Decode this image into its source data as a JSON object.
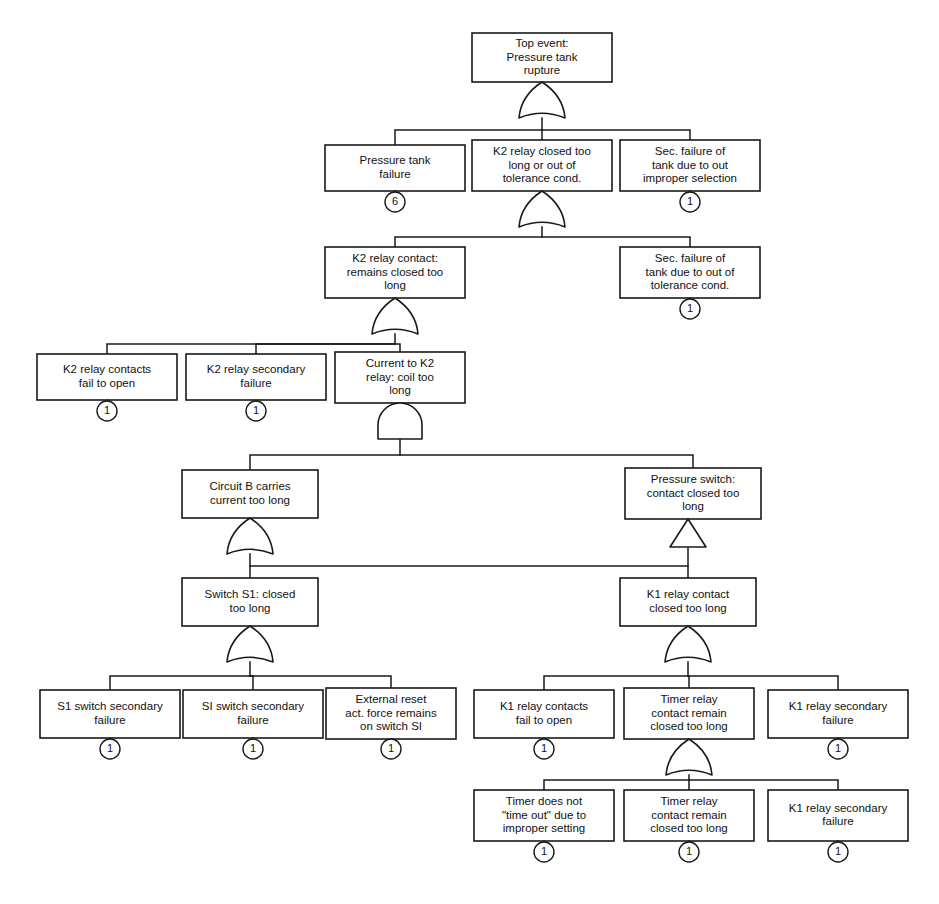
{
  "diagram": {
    "kind": "fault-tree",
    "width": 939,
    "height": 904,
    "colors": {
      "background": "#ffffff",
      "stroke": "#1a1a1a",
      "text": "#111111",
      "box_fill": "#ffffff"
    }
  },
  "nodes": [
    {
      "id": "top-event",
      "label": "Top event:\nPressure tank\nrupture",
      "x": 472,
      "y": 33,
      "w": 140,
      "h": 49,
      "gate": {
        "type": "or",
        "cx": 542,
        "cy": 82,
        "w": 46,
        "h": 36
      },
      "marker": null
    },
    {
      "id": "pressure-tank-failure",
      "label": "Pressure tank\nfailure",
      "x": 325,
      "y": 145,
      "w": 140,
      "h": 46,
      "gate": null,
      "marker": {
        "type": "circle",
        "value": "6",
        "cx": 395,
        "cy": 202,
        "r": 10
      }
    },
    {
      "id": "k2-relay-closed-too-long",
      "label": "K2 relay closed too\nlong or out of\ntolerance cond.",
      "x": 472,
      "y": 140,
      "w": 140,
      "h": 51,
      "gate": {
        "type": "or",
        "cx": 542,
        "cy": 191,
        "w": 46,
        "h": 36
      },
      "marker": null
    },
    {
      "id": "sec-failure-tank-improper-selection",
      "label": "Sec. failure of\ntank due to out\nimproper selection",
      "x": 620,
      "y": 140,
      "w": 140,
      "h": 51,
      "gate": null,
      "marker": {
        "type": "circle",
        "value": "1",
        "cx": 690,
        "cy": 202,
        "r": 10
      }
    },
    {
      "id": "k2-relay-contact-remains-closed",
      "label": "K2 relay contact:\nremains closed too\nlong",
      "x": 325,
      "y": 247,
      "w": 140,
      "h": 51,
      "gate": {
        "type": "or",
        "cx": 395,
        "cy": 298,
        "w": 46,
        "h": 36
      },
      "marker": null
    },
    {
      "id": "sec-failure-tank-tolerance",
      "label": "Sec. failure of\ntank due to out of\ntolerance cond.",
      "x": 620,
      "y": 247,
      "w": 140,
      "h": 51,
      "gate": null,
      "marker": {
        "type": "circle",
        "value": "1",
        "cx": 690,
        "cy": 309,
        "r": 10
      }
    },
    {
      "id": "k2-relay-contacts-fail-to-open",
      "label": "K2 relay contacts\nfail to open",
      "x": 37,
      "y": 354,
      "w": 140,
      "h": 46,
      "gate": null,
      "marker": {
        "type": "circle",
        "value": "1",
        "cx": 107,
        "cy": 411,
        "r": 10
      }
    },
    {
      "id": "k2-relay-secondary-failure",
      "label": "K2 relay secondary\nfailure",
      "x": 186,
      "y": 354,
      "w": 140,
      "h": 46,
      "gate": null,
      "marker": {
        "type": "circle",
        "value": "1",
        "cx": 256,
        "cy": 411,
        "r": 10
      }
    },
    {
      "id": "current-to-k2-relay-coil-too-long",
      "label": "Current to K2\nrelay: coil too\nlong",
      "x": 335,
      "y": 352,
      "w": 130,
      "h": 51,
      "gate": {
        "type": "and",
        "cx": 400,
        "cy": 403,
        "w": 44,
        "h": 36
      },
      "marker": null
    },
    {
      "id": "circuit-b-carries-current-too-long",
      "label": "Circuit B carries\ncurrent too long",
      "x": 182,
      "y": 470,
      "w": 136,
      "h": 48,
      "gate": {
        "type": "or",
        "cx": 250,
        "cy": 518,
        "w": 46,
        "h": 36
      },
      "marker": null
    },
    {
      "id": "pressure-switch-contact-closed",
      "label": "Pressure switch:\ncontact closed too\nlong",
      "x": 625,
      "y": 468,
      "w": 136,
      "h": 51,
      "gate": {
        "type": "transfer",
        "cx": 688,
        "cy": 519,
        "w": 36,
        "h": 28
      },
      "marker": null
    },
    {
      "id": "switch-s1-closed-too-long",
      "label": "Switch S1: closed\ntoo long",
      "x": 182,
      "y": 578,
      "w": 136,
      "h": 48,
      "gate": {
        "type": "or",
        "cx": 250,
        "cy": 626,
        "w": 46,
        "h": 36
      },
      "marker": null
    },
    {
      "id": "k1-relay-contact-closed-too-long",
      "label": "K1 relay contact\nclosed too long",
      "x": 620,
      "y": 578,
      "w": 136,
      "h": 48,
      "gate": {
        "type": "or",
        "cx": 688,
        "cy": 626,
        "w": 46,
        "h": 36
      },
      "marker": null
    },
    {
      "id": "s1-switch-secondary-failure",
      "label": "S1 switch secondary\nfailure",
      "x": 40,
      "y": 690,
      "w": 140,
      "h": 48,
      "gate": null,
      "marker": {
        "type": "circle",
        "value": "1",
        "cx": 110,
        "cy": 749,
        "r": 10
      }
    },
    {
      "id": "si-switch-secondary-failure",
      "label": "SI switch secondary\nfailure",
      "x": 183,
      "y": 690,
      "w": 140,
      "h": 48,
      "gate": null,
      "marker": {
        "type": "circle",
        "value": "1",
        "cx": 253,
        "cy": 749,
        "r": 10
      }
    },
    {
      "id": "external-reset-act-force",
      "label": "External reset\nact. force remains\non switch SI",
      "x": 326,
      "y": 688,
      "w": 130,
      "h": 51,
      "gate": null,
      "marker": {
        "type": "circle",
        "value": "1",
        "cx": 391,
        "cy": 749,
        "r": 10
      }
    },
    {
      "id": "k1-relay-contacts-fail-to-open",
      "label": "K1 relay contacts\nfail to open",
      "x": 474,
      "y": 690,
      "w": 140,
      "h": 48,
      "gate": null,
      "marker": {
        "type": "circle",
        "value": "1",
        "cx": 544,
        "cy": 749,
        "r": 10
      }
    },
    {
      "id": "timer-relay-contact-remain-closed-1",
      "label": "Timer relay\ncontact remain\nclosed too long",
      "x": 624,
      "y": 688,
      "w": 130,
      "h": 51,
      "gate": {
        "type": "or",
        "cx": 689,
        "cy": 739,
        "w": 46,
        "h": 36
      },
      "marker": null
    },
    {
      "id": "k1-relay-secondary-failure-1",
      "label": "K1 relay secondary\nfailure",
      "x": 768,
      "y": 690,
      "w": 140,
      "h": 48,
      "gate": null,
      "marker": {
        "type": "circle",
        "value": "1",
        "cx": 838,
        "cy": 749,
        "r": 10
      }
    },
    {
      "id": "timer-does-not-time-out",
      "label": "Timer does not\n\"time out\" due to\nimproper setting",
      "x": 474,
      "y": 790,
      "w": 140,
      "h": 51,
      "gate": null,
      "marker": {
        "type": "circle",
        "value": "1",
        "cx": 544,
        "cy": 852,
        "r": 10
      }
    },
    {
      "id": "timer-relay-contact-remain-closed-2",
      "label": "Timer relay\ncontact remain\nclosed too long",
      "x": 624,
      "y": 790,
      "w": 130,
      "h": 51,
      "gate": null,
      "marker": {
        "type": "circle",
        "value": "1",
        "cx": 689,
        "cy": 852,
        "r": 10
      }
    },
    {
      "id": "k1-relay-secondary-failure-2",
      "label": "K1 relay secondary\nfailure",
      "x": 768,
      "y": 790,
      "w": 140,
      "h": 51,
      "gate": null,
      "marker": {
        "type": "circle",
        "value": "1",
        "cx": 838,
        "cy": 852,
        "r": 10
      }
    }
  ],
  "connectors": [
    {
      "id": "c-top-to-row2",
      "name": "top-event-branch",
      "points": "542,118 542,130 395,130 395,145"
    },
    {
      "id": "c-top-to-row2-mid",
      "name": "top-event-branch-mid",
      "points": "542,130 542,140"
    },
    {
      "id": "c-top-to-row2-right",
      "name": "top-event-branch-right",
      "points": "542,130 690,130 690,140"
    },
    {
      "id": "c-k2closed-to-row3",
      "name": "k2-closed-branch",
      "points": "542,227 542,237 395,237 395,247"
    },
    {
      "id": "c-k2closed-to-row3-right",
      "name": "k2-closed-branch-right",
      "points": "542,237 690,237 690,247"
    },
    {
      "id": "c-k2contact-to-row4-left",
      "name": "k2-contact-branch-left",
      "points": "395,334 395,344 107,344 107,354"
    },
    {
      "id": "c-k2contact-to-row4-mid",
      "name": "k2-contact-branch-mid",
      "points": "395,344 256,344 256,354"
    },
    {
      "id": "c-k2contact-to-row4-right",
      "name": "k2-contact-branch-right",
      "points": "395,344 400,344 400,352"
    },
    {
      "id": "c-and-to-row5-left",
      "name": "and-gate-branch-left",
      "points": "400,439 400,455 250,455 250,470"
    },
    {
      "id": "c-and-to-row5-right",
      "name": "and-gate-branch-right",
      "points": "400,455 693,455 693,468"
    },
    {
      "id": "c-circuitb-to-switch",
      "name": "circuit-b-branch",
      "points": "250,554 250,566 250,578"
    },
    {
      "id": "c-pressure-switch-to-k1",
      "name": "pressure-switch-branch",
      "points": "688,547 688,566 688,578"
    },
    {
      "id": "c-transfer-line",
      "name": "transfer-branch-line",
      "points": "250,566 688,566"
    },
    {
      "id": "c-switchs1-to-row7-left",
      "name": "switch-s1-branch-left",
      "points": "250,662 250,676 110,676 110,690"
    },
    {
      "id": "c-switchs1-to-row7-mid",
      "name": "switch-s1-branch-mid",
      "points": "250,676 253,676 253,690"
    },
    {
      "id": "c-switchs1-to-row7-right",
      "name": "switch-s1-branch-right",
      "points": "250,676 391,676 391,688"
    },
    {
      "id": "c-k1contact-to-row7-left",
      "name": "k1-contact-branch-left",
      "points": "688,662 688,676 544,676 544,690"
    },
    {
      "id": "c-k1contact-to-row7-mid",
      "name": "k1-contact-branch-mid",
      "points": "688,676 689,676 689,688"
    },
    {
      "id": "c-k1contact-to-row7-right",
      "name": "k1-contact-branch-right",
      "points": "688,676 838,676 838,690"
    },
    {
      "id": "c-timer-to-row8-left",
      "name": "timer-relay-branch-left",
      "points": "689,775 689,780 544,780 544,790"
    },
    {
      "id": "c-timer-to-row8-mid",
      "name": "timer-relay-branch-mid",
      "points": "689,780 689,790"
    },
    {
      "id": "c-timer-to-row8-right",
      "name": "timer-relay-branch-right",
      "points": "689,780 838,780 838,790"
    }
  ]
}
